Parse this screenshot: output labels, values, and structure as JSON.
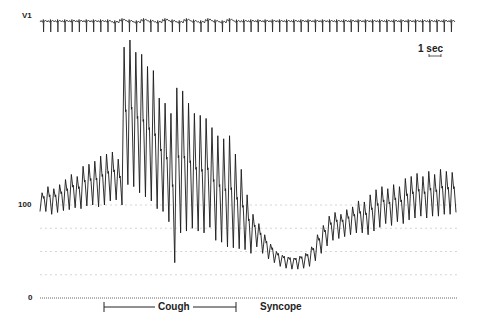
{
  "chart_data": {
    "type": "line",
    "title": "",
    "lead_label": "V1",
    "ylabel": "",
    "xlabel": "",
    "y_ticks": [
      {
        "value": 0,
        "label": "0"
      },
      {
        "value": 100,
        "label": "100"
      }
    ],
    "ylim": [
      0,
      160
    ],
    "grid_lines_mmHg": [
      25,
      50,
      75,
      100
    ],
    "time_scale": {
      "label": "1 sec",
      "bar_px": 12
    },
    "annotations": [
      {
        "label": "Cough",
        "x_start_px": 104,
        "x_end_px": 236,
        "type": "bracket"
      },
      {
        "label": "Syncope",
        "x_px": 260,
        "type": "text"
      }
    ],
    "series": [
      {
        "name": "V1 ECG",
        "beats_px_x_start": 40,
        "beats_px_x_end": 455,
        "beat_count": 58
      },
      {
        "name": "Arterial pressure (mmHg)",
        "beats": [
          {
            "sys": 112,
            "dia": 93
          },
          {
            "sys": 118,
            "dia": 90
          },
          {
            "sys": 116,
            "dia": 92
          },
          {
            "sys": 120,
            "dia": 94
          },
          {
            "sys": 125,
            "dia": 95
          },
          {
            "sys": 130,
            "dia": 97
          },
          {
            "sys": 128,
            "dia": 96
          },
          {
            "sys": 138,
            "dia": 99
          },
          {
            "sys": 140,
            "dia": 100
          },
          {
            "sys": 143,
            "dia": 98
          },
          {
            "sys": 148,
            "dia": 100
          },
          {
            "sys": 150,
            "dia": 104
          },
          {
            "sys": 152,
            "dia": 105
          },
          {
            "sys": 145,
            "dia": 100
          },
          {
            "sys": 255,
            "dia": 120
          },
          {
            "sys": 262,
            "dia": 118
          },
          {
            "sys": 250,
            "dia": 112
          },
          {
            "sys": 248,
            "dia": 108
          },
          {
            "sys": 236,
            "dia": 104
          },
          {
            "sys": 232,
            "dia": 96
          },
          {
            "sys": 205,
            "dia": 93
          },
          {
            "sys": 200,
            "dia": 82
          },
          {
            "sys": 190,
            "dia": 38
          },
          {
            "sys": 215,
            "dia": 70
          },
          {
            "sys": 212,
            "dia": 72
          },
          {
            "sys": 200,
            "dia": 75
          },
          {
            "sys": 190,
            "dia": 72
          },
          {
            "sys": 188,
            "dia": 70
          },
          {
            "sys": 185,
            "dia": 76
          },
          {
            "sys": 176,
            "dia": 62
          },
          {
            "sys": 168,
            "dia": 60
          },
          {
            "sys": 165,
            "dia": 55
          },
          {
            "sys": 168,
            "dia": 54
          },
          {
            "sys": 150,
            "dia": 53
          },
          {
            "sys": 135,
            "dia": 52
          },
          {
            "sys": 110,
            "dia": 48
          },
          {
            "sys": 90,
            "dia": 55
          },
          {
            "sys": 80,
            "dia": 48
          },
          {
            "sys": 68,
            "dia": 42
          },
          {
            "sys": 58,
            "dia": 38
          },
          {
            "sys": 50,
            "dia": 34
          },
          {
            "sys": 46,
            "dia": 32
          },
          {
            "sys": 44,
            "dia": 31
          },
          {
            "sys": 43,
            "dia": 31
          },
          {
            "sys": 45,
            "dia": 32
          },
          {
            "sys": 48,
            "dia": 34
          },
          {
            "sys": 55,
            "dia": 40
          },
          {
            "sys": 68,
            "dia": 48
          },
          {
            "sys": 78,
            "dia": 56
          },
          {
            "sys": 88,
            "dia": 62
          },
          {
            "sys": 92,
            "dia": 64
          },
          {
            "sys": 90,
            "dia": 66
          },
          {
            "sys": 95,
            "dia": 68
          },
          {
            "sys": 98,
            "dia": 70
          },
          {
            "sys": 104,
            "dia": 70
          },
          {
            "sys": 103,
            "dia": 68
          },
          {
            "sys": 110,
            "dia": 72
          },
          {
            "sys": 115,
            "dia": 76
          },
          {
            "sys": 118,
            "dia": 80
          },
          {
            "sys": 116,
            "dia": 78
          },
          {
            "sys": 120,
            "dia": 82
          },
          {
            "sys": 118,
            "dia": 80
          },
          {
            "sys": 126,
            "dia": 84
          },
          {
            "sys": 128,
            "dia": 86
          },
          {
            "sys": 131,
            "dia": 88
          },
          {
            "sys": 128,
            "dia": 86
          },
          {
            "sys": 133,
            "dia": 88
          },
          {
            "sys": 130,
            "dia": 88
          },
          {
            "sys": 135,
            "dia": 90
          },
          {
            "sys": 133,
            "dia": 90
          },
          {
            "sys": 132,
            "dia": 92
          }
        ]
      }
    ]
  },
  "labels": {
    "lead": "V1",
    "y100": "100",
    "y0": "0",
    "scale": "1 sec",
    "cough": "Cough",
    "syncope": "Syncope"
  }
}
